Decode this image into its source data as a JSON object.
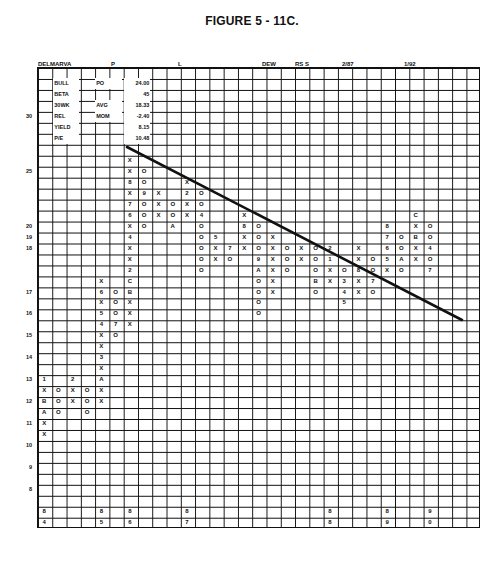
{
  "figure_title": "FIGURE 5 - 11C.",
  "header_labels": [
    {
      "text": "DELMARVA",
      "x": 38
    },
    {
      "text": "P",
      "x": 111
    },
    {
      "text": "L",
      "x": 178
    },
    {
      "text": "DEW",
      "x": 262
    },
    {
      "text": "RS  S",
      "x": 295
    },
    {
      "text": "2/87",
      "x": 342
    },
    {
      "text": "1/92",
      "x": 404
    }
  ],
  "stats_box": [
    {
      "label": "BULL",
      "key": "PO",
      "value": "24.00"
    },
    {
      "label": "BETA",
      "key": "",
      "value": "45"
    },
    {
      "label": "30WK",
      "key": "AVG",
      "value": "18.33"
    },
    {
      "label": "REL",
      "key": "MOM",
      "value": "-2.40"
    },
    {
      "label": "YIELD",
      "key": "",
      "value": "8.15"
    },
    {
      "label": "P/E",
      "key": "",
      "value": "10.48"
    }
  ],
  "chart_data": {
    "type": "point-and-figure",
    "title": "FIGURE 5 - 11C.",
    "symbol": "DELMARVA",
    "grid": {
      "columns": 31,
      "rows": 42
    },
    "y_axis_labels": [
      {
        "value": "30",
        "row": 4
      },
      {
        "value": "25",
        "row": 9
      },
      {
        "value": "20",
        "row": 14
      },
      {
        "value": "19",
        "row": 15
      },
      {
        "value": "18",
        "row": 16
      },
      {
        "value": "17",
        "row": 20
      },
      {
        "value": "16",
        "row": 22
      },
      {
        "value": "15",
        "row": 24
      },
      {
        "value": "14",
        "row": 26
      },
      {
        "value": "13",
        "row": 28
      },
      {
        "value": "12",
        "row": 30
      },
      {
        "value": "11",
        "row": 32
      },
      {
        "value": "10",
        "row": 34
      },
      {
        "value": "9",
        "row": 36
      },
      {
        "value": "8",
        "row": 38
      }
    ],
    "year_markers_bottom": [
      {
        "col": 0,
        "top": "8",
        "bottom": "4"
      },
      {
        "col": 4,
        "top": "8",
        "bottom": "5"
      },
      {
        "col": 6,
        "top": "8",
        "bottom": "6"
      },
      {
        "col": 10,
        "top": "8",
        "bottom": "7"
      },
      {
        "col": 20,
        "top": "8",
        "bottom": "8"
      },
      {
        "col": 24,
        "top": "8",
        "bottom": "9"
      },
      {
        "col": 27,
        "top": "9",
        "bottom": "0"
      }
    ],
    "trendline": {
      "from": [
        127,
        147
      ],
      "to": [
        462,
        320
      ],
      "label": "bearish resistance line"
    },
    "cells": [
      [
        28,
        0,
        "1"
      ],
      [
        29,
        0,
        "X"
      ],
      [
        30,
        0,
        "B"
      ],
      [
        31,
        0,
        "A"
      ],
      [
        32,
        0,
        "X"
      ],
      [
        33,
        0,
        "X"
      ],
      [
        29,
        1,
        "O"
      ],
      [
        30,
        1,
        "O"
      ],
      [
        31,
        1,
        "O"
      ],
      [
        28,
        2,
        "2"
      ],
      [
        29,
        2,
        "X"
      ],
      [
        30,
        2,
        "X"
      ],
      [
        29,
        3,
        "O"
      ],
      [
        30,
        3,
        "O"
      ],
      [
        31,
        3,
        "O"
      ],
      [
        19,
        4,
        "X"
      ],
      [
        20,
        4,
        "6"
      ],
      [
        21,
        4,
        "X"
      ],
      [
        22,
        4,
        "5"
      ],
      [
        23,
        4,
        "4"
      ],
      [
        24,
        4,
        "X"
      ],
      [
        25,
        4,
        "X"
      ],
      [
        26,
        4,
        "3"
      ],
      [
        27,
        4,
        "X"
      ],
      [
        28,
        4,
        "A"
      ],
      [
        29,
        4,
        "X"
      ],
      [
        30,
        4,
        "X"
      ],
      [
        20,
        5,
        "O"
      ],
      [
        21,
        5,
        "O"
      ],
      [
        22,
        5,
        "O"
      ],
      [
        23,
        5,
        "7"
      ],
      [
        24,
        5,
        "O"
      ],
      [
        8,
        6,
        "X"
      ],
      [
        9,
        6,
        "X"
      ],
      [
        10,
        6,
        "8"
      ],
      [
        11,
        6,
        "X"
      ],
      [
        12,
        6,
        "7"
      ],
      [
        13,
        6,
        "6"
      ],
      [
        14,
        6,
        "X"
      ],
      [
        15,
        6,
        "4"
      ],
      [
        16,
        6,
        "X"
      ],
      [
        17,
        6,
        "X"
      ],
      [
        18,
        6,
        "2"
      ],
      [
        19,
        6,
        "C"
      ],
      [
        20,
        6,
        "B"
      ],
      [
        21,
        6,
        "X"
      ],
      [
        22,
        6,
        "X"
      ],
      [
        23,
        6,
        "X"
      ],
      [
        9,
        7,
        "O"
      ],
      [
        10,
        7,
        "O"
      ],
      [
        11,
        7,
        "9"
      ],
      [
        12,
        7,
        "O"
      ],
      [
        13,
        7,
        "O"
      ],
      [
        14,
        7,
        "O"
      ],
      [
        11,
        8,
        "X"
      ],
      [
        12,
        8,
        "X"
      ],
      [
        13,
        8,
        "X"
      ],
      [
        12,
        9,
        "O"
      ],
      [
        13,
        9,
        "O"
      ],
      [
        14,
        9,
        "A"
      ],
      [
        10,
        10,
        "X"
      ],
      [
        11,
        10,
        "2"
      ],
      [
        12,
        10,
        "X"
      ],
      [
        13,
        10,
        "X"
      ],
      [
        11,
        11,
        "O"
      ],
      [
        12,
        11,
        "O"
      ],
      [
        13,
        11,
        "4"
      ],
      [
        14,
        11,
        "O"
      ],
      [
        15,
        11,
        "O"
      ],
      [
        16,
        11,
        "O"
      ],
      [
        17,
        11,
        "O"
      ],
      [
        18,
        11,
        "O"
      ],
      [
        15,
        12,
        "5"
      ],
      [
        16,
        12,
        "X"
      ],
      [
        17,
        12,
        "X"
      ],
      [
        16,
        13,
        "7"
      ],
      [
        17,
        13,
        "O"
      ],
      [
        13,
        14,
        "X"
      ],
      [
        14,
        14,
        "8"
      ],
      [
        15,
        14,
        "X"
      ],
      [
        16,
        14,
        "X"
      ],
      [
        14,
        15,
        "O"
      ],
      [
        15,
        15,
        "O"
      ],
      [
        16,
        15,
        "O"
      ],
      [
        17,
        15,
        "9"
      ],
      [
        18,
        15,
        "A"
      ],
      [
        19,
        15,
        "O"
      ],
      [
        20,
        15,
        "O"
      ],
      [
        21,
        15,
        "O"
      ],
      [
        22,
        15,
        "O"
      ],
      [
        15,
        16,
        "X"
      ],
      [
        16,
        16,
        "X"
      ],
      [
        17,
        16,
        "X"
      ],
      [
        18,
        16,
        "X"
      ],
      [
        19,
        16,
        "X"
      ],
      [
        20,
        16,
        "X"
      ],
      [
        16,
        17,
        "O"
      ],
      [
        17,
        17,
        "O"
      ],
      [
        18,
        17,
        "O"
      ],
      [
        16,
        18,
        "X"
      ],
      [
        17,
        18,
        "X"
      ],
      [
        16,
        19,
        "O"
      ],
      [
        17,
        19,
        "O"
      ],
      [
        18,
        19,
        "O"
      ],
      [
        19,
        19,
        "B"
      ],
      [
        20,
        19,
        "O"
      ],
      [
        16,
        20,
        "2"
      ],
      [
        17,
        20,
        "1"
      ],
      [
        18,
        20,
        "X"
      ],
      [
        19,
        20,
        "X"
      ],
      [
        18,
        21,
        "O"
      ],
      [
        19,
        21,
        "3"
      ],
      [
        20,
        21,
        "4"
      ],
      [
        21,
        21,
        "5"
      ],
      [
        16,
        22,
        "X"
      ],
      [
        17,
        22,
        "X"
      ],
      [
        18,
        22,
        "8"
      ],
      [
        19,
        22,
        "X"
      ],
      [
        20,
        22,
        "X"
      ],
      [
        17,
        23,
        "O"
      ],
      [
        18,
        23,
        "O"
      ],
      [
        19,
        23,
        "7"
      ],
      [
        20,
        23,
        "O"
      ],
      [
        14,
        24,
        "8"
      ],
      [
        15,
        24,
        "7"
      ],
      [
        16,
        24,
        "6"
      ],
      [
        17,
        24,
        "5"
      ],
      [
        18,
        24,
        "X"
      ],
      [
        15,
        25,
        "O"
      ],
      [
        16,
        25,
        "O"
      ],
      [
        17,
        25,
        "A"
      ],
      [
        18,
        25,
        "O"
      ],
      [
        13,
        26,
        "C"
      ],
      [
        14,
        26,
        "X"
      ],
      [
        15,
        26,
        "B"
      ],
      [
        16,
        26,
        "X"
      ],
      [
        17,
        26,
        "X"
      ],
      [
        14,
        27,
        "O"
      ],
      [
        15,
        27,
        "O"
      ],
      [
        16,
        27,
        "4"
      ],
      [
        17,
        27,
        "O"
      ],
      [
        18,
        27,
        "7"
      ]
    ]
  }
}
